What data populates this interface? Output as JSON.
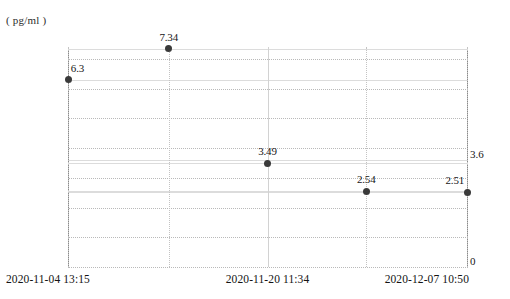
{
  "chart_data": {
    "type": "scatter",
    "title": "",
    "subtitle": "",
    "unit_label": "( pg/ml )",
    "xlabel": "",
    "ylabel": "",
    "ylim": [
      0,
      7.4
    ],
    "xlim_labels": [
      "2020-11-04 13:15",
      "2020-11-20 11:34",
      "2020-12-07 10:50"
    ],
    "grid": true,
    "legend": "none",
    "y_ticks": [
      "0",
      "1",
      "2",
      "3",
      "4",
      "5",
      "6",
      "7"
    ],
    "y_tick_values": [
      0,
      1,
      2,
      3,
      4,
      5,
      6,
      7
    ],
    "x_tick_labels": [
      "2020-11-04 13:15",
      "2020-11-20 11:34",
      "2020-12-07 10:50"
    ],
    "series": [
      {
        "name": "concentration",
        "point_color": "#3a3a3a",
        "points": [
          {
            "label": "6.3",
            "value": 6.3,
            "x_frac": 0.0
          },
          {
            "label": "7.34",
            "value": 7.34,
            "x_frac": 0.2525
          },
          {
            "label": "3.49",
            "value": 3.49,
            "x_frac": 0.5
          },
          {
            "label": "2.54",
            "value": 2.54,
            "x_frac": 0.7475
          },
          {
            "label": "2.51",
            "value": 2.51,
            "x_frac": 1.0
          }
        ]
      }
    ],
    "annotations": [
      {
        "name": "right-axis-value",
        "text": "3.6",
        "value": 3.6
      },
      {
        "name": "right-axis-zero",
        "text": "0",
        "value": 0
      }
    ],
    "colors": {
      "point": "#3a3a3a",
      "axis": "#8a8a8a",
      "gridline_dotted": "#b9b9b9",
      "gridline_solid": "#dcdcdc",
      "text": "#161616",
      "background": "#ffffff"
    }
  }
}
